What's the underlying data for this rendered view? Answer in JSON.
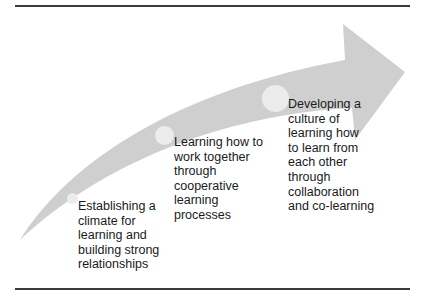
{
  "diagram": {
    "type": "curved-progression-arrow",
    "colors": {
      "arrow": "#cfcfcf",
      "node": "#ececec",
      "text": "#1a1a1a",
      "rule": "#3a3a3a"
    },
    "stages": [
      {
        "label": "Establishing a\nclimate for\nlearning and\nbuilding strong\nrelationships"
      },
      {
        "label": "Learning how to\nwork together\nthrough\ncooperative\nlearning\nprocesses"
      },
      {
        "label": "Developing a\nculture of\nlearning how\nto learn from\neach other\nthrough\ncollaboration\nand co-learning"
      }
    ]
  }
}
